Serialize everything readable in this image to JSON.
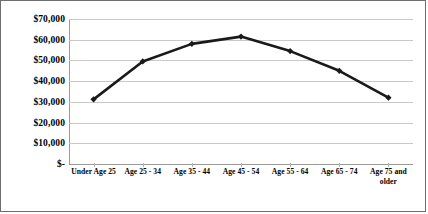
{
  "chart_data": {
    "type": "line",
    "title": "",
    "xlabel": "",
    "ylabel": "",
    "categories": [
      "Under Age 25",
      "Age 25 - 34",
      "Age 35 - 44",
      "Age 45 - 54",
      "Age 55 - 64",
      "Age 65 - 74",
      "Age 75 and older"
    ],
    "values": [
      31200,
      49500,
      58000,
      61500,
      54500,
      45000,
      32000
    ],
    "ylim": [
      0,
      70000
    ],
    "ytick_values": [
      0,
      10000,
      20000,
      30000,
      40000,
      50000,
      60000,
      70000
    ],
    "ytick_labels": [
      "$-",
      "$10,000",
      "$20,000",
      "$30,000",
      "$40,000",
      "$50,000",
      "$60,000",
      "$70,000"
    ],
    "grid": true,
    "legend": false,
    "legend_position": "none",
    "series": [
      {
        "name": "",
        "values": [
          31200,
          49500,
          58000,
          61500,
          54500,
          45000,
          32000
        ],
        "color": "#1a1a1a",
        "marker": "diamond",
        "line_width": 2.6
      }
    ],
    "colors": {
      "line": "#1a1a1a",
      "marker": "#1a1a1a",
      "gridline": "#c9c9c9",
      "axis": "#9a9a9a",
      "frame": "#6e6e6e",
      "background": "#ffffff",
      "text": "#000000"
    }
  }
}
